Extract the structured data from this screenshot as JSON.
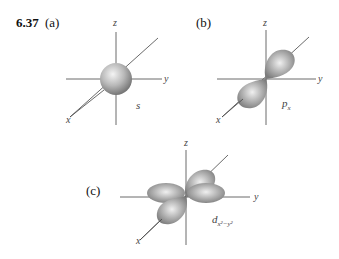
{
  "figure": {
    "problem_number": "6.37",
    "panels": [
      {
        "part": "(a)",
        "orbital": "s",
        "orbital_subscript": "",
        "axes": {
          "x": "x",
          "y": "y",
          "z": "z"
        }
      },
      {
        "part": "(b)",
        "orbital": "p",
        "orbital_subscript": "x",
        "axes": {
          "x": "x",
          "y": "y",
          "z": "z"
        }
      },
      {
        "part": "(c)",
        "orbital": "d",
        "orbital_subscript": "x²−y²",
        "axes": {
          "x": "x",
          "y": "y",
          "z": "z"
        }
      }
    ],
    "colors": {
      "axis": "#333333",
      "lobe_light": "#f2f2f2",
      "lobe_dark": "#7a7a7a"
    }
  }
}
